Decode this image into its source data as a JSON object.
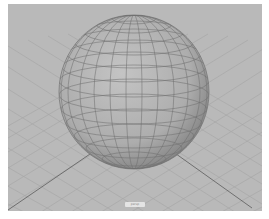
{
  "viewport": {
    "camera_label": "persp",
    "background_color": "#b9b9b9",
    "grid_color": "#a3a3a3",
    "axis_color": "#5a5a5a",
    "object": {
      "type": "sphere",
      "shading": "wireframe-on-shaded",
      "fill_color": "#b0b0b0",
      "wire_color": "#6e6e6e"
    }
  }
}
